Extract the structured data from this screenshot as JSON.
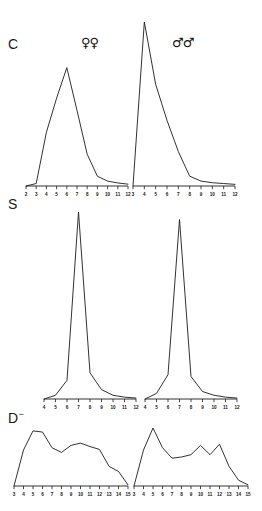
{
  "figure": {
    "background_color": "#ffffff",
    "line_color": "#1b1b1b",
    "row_labels": [
      {
        "key": "C",
        "text": "C",
        "superscript": ""
      },
      {
        "key": "S",
        "text": "S",
        "superscript": ""
      },
      {
        "key": "D",
        "text": "D",
        "superscript": "−"
      }
    ],
    "column_labels": [
      {
        "key": "females",
        "symbol": "♀♀",
        "name": "female-symbol"
      },
      {
        "key": "males",
        "symbol": "♂♂",
        "name": "male-symbol"
      }
    ]
  },
  "chart_data": [
    {
      "id": "C-females",
      "type": "line",
      "title": "C",
      "series_label": "♀♀",
      "xlabel": "",
      "ylabel": "",
      "grid": false,
      "legend": "none",
      "xlim": [
        2,
        12
      ],
      "ylim": [
        0,
        100
      ],
      "ticks": [
        2,
        3,
        4,
        5,
        6,
        7,
        8,
        9,
        10,
        11,
        12
      ],
      "x": [
        2,
        3,
        4,
        5,
        6,
        7,
        8,
        9,
        10,
        11,
        12
      ],
      "values": [
        0,
        2,
        44,
        72,
        97,
        62,
        26,
        8,
        4,
        2.5,
        1.5
      ]
    },
    {
      "id": "C-males",
      "type": "line",
      "title": "C",
      "series_label": "♂♂",
      "xlabel": "",
      "ylabel": "",
      "grid": false,
      "legend": "none",
      "xlim": [
        3,
        12
      ],
      "ylim": [
        0,
        100
      ],
      "ticks": [
        3,
        4,
        5,
        6,
        7,
        8,
        9,
        10,
        11,
        12
      ],
      "x": [
        3,
        4,
        5,
        6,
        7,
        8,
        9,
        10,
        11,
        12
      ],
      "values": [
        0,
        100,
        62,
        40,
        21,
        6,
        3,
        2,
        1.5,
        1
      ]
    },
    {
      "id": "S-females",
      "type": "line",
      "title": "S",
      "series_label": "♀♀",
      "xlabel": "",
      "ylabel": "",
      "grid": false,
      "legend": "none",
      "xlim": [
        4,
        12
      ],
      "ylim": [
        0,
        100
      ],
      "ticks": [
        4,
        5,
        6,
        7,
        8,
        9,
        10,
        11,
        12
      ],
      "x": [
        4,
        5,
        6,
        7,
        8,
        9,
        10,
        11,
        12
      ],
      "values": [
        0,
        2,
        10,
        100,
        14,
        5,
        2,
        1,
        0.5
      ]
    },
    {
      "id": "S-males",
      "type": "line",
      "title": "S",
      "series_label": "♂♂",
      "xlabel": "",
      "ylabel": "",
      "grid": false,
      "legend": "none",
      "xlim": [
        4,
        12
      ],
      "ylim": [
        0,
        100
      ],
      "ticks": [
        4,
        5,
        6,
        7,
        8,
        9,
        10,
        11,
        12
      ],
      "x": [
        4,
        5,
        6,
        7,
        8,
        9,
        10,
        11,
        12
      ],
      "values": [
        0,
        3,
        13,
        96,
        12,
        4,
        2,
        1,
        0.5
      ]
    },
    {
      "id": "D-females",
      "type": "line",
      "title": "D−",
      "series_label": "♀♀",
      "xlabel": "",
      "ylabel": "",
      "grid": false,
      "legend": "none",
      "xlim": [
        3,
        15
      ],
      "ylim": [
        0,
        100
      ],
      "ticks": [
        3,
        4,
        5,
        6,
        7,
        8,
        9,
        10,
        11,
        12,
        13,
        14,
        15
      ],
      "x": [
        3,
        4,
        5,
        6,
        7,
        8,
        9,
        10,
        11,
        12,
        13,
        14,
        15
      ],
      "values": [
        0,
        62,
        95,
        93,
        66,
        58,
        70,
        74,
        68,
        63,
        34,
        25,
        2
      ]
    },
    {
      "id": "D-males",
      "type": "line",
      "title": "D−",
      "series_label": "♂♂",
      "xlabel": "",
      "ylabel": "",
      "grid": false,
      "legend": "none",
      "xlim": [
        3,
        15
      ],
      "ticks": [
        3,
        4,
        5,
        6,
        7,
        8,
        9,
        10,
        11,
        12,
        13,
        14,
        15
      ],
      "ylim": [
        0,
        100
      ],
      "x": [
        3,
        4,
        5,
        6,
        7,
        8,
        9,
        10,
        11,
        12,
        13,
        14,
        15
      ],
      "values": [
        0,
        62,
        100,
        66,
        48,
        50,
        54,
        70,
        54,
        72,
        34,
        10,
        2
      ]
    }
  ],
  "panel_layout": [
    {
      "id": "C-females",
      "x": 26,
      "y": 62,
      "w": 102,
      "h": 120,
      "tick_y": 186
    },
    {
      "id": "C-males",
      "x": 133,
      "y": 20,
      "w": 102,
      "h": 162,
      "tick_y": 186
    },
    {
      "id": "S-females",
      "x": 44,
      "y": 210,
      "w": 92,
      "h": 185,
      "tick_y": 399
    },
    {
      "id": "S-males",
      "x": 145,
      "y": 210,
      "w": 92,
      "h": 185,
      "tick_y": 399
    },
    {
      "id": "D-females",
      "x": 14,
      "y": 426,
      "w": 114,
      "h": 56,
      "tick_y": 486
    },
    {
      "id": "D-males",
      "x": 134,
      "y": 426,
      "w": 114,
      "h": 56,
      "tick_y": 486
    }
  ],
  "label_layout": {
    "row_C": {
      "x": 8,
      "y": 36
    },
    "row_S": {
      "x": 8,
      "y": 196
    },
    "row_D": {
      "x": 8,
      "y": 410
    },
    "sex_female": {
      "x": 81,
      "y": 36
    },
    "sex_male": {
      "x": 172,
      "y": 36
    }
  }
}
